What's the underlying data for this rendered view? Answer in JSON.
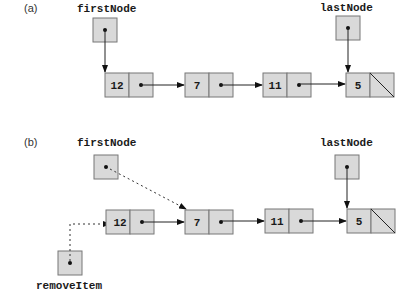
{
  "colors": {
    "node_fill": "#d9d9d9",
    "node_border": "#777777",
    "line": "#222222"
  },
  "part_a": {
    "label": "(a)",
    "first_label": "firstNode",
    "last_label": "lastNode",
    "nodes": [
      "12",
      "7",
      "11",
      "5"
    ]
  },
  "part_b": {
    "label": "(b)",
    "first_label": "firstNode",
    "last_label": "lastNode",
    "remove_label": "removeItem",
    "nodes": [
      "12",
      "7",
      "11",
      "5"
    ]
  }
}
